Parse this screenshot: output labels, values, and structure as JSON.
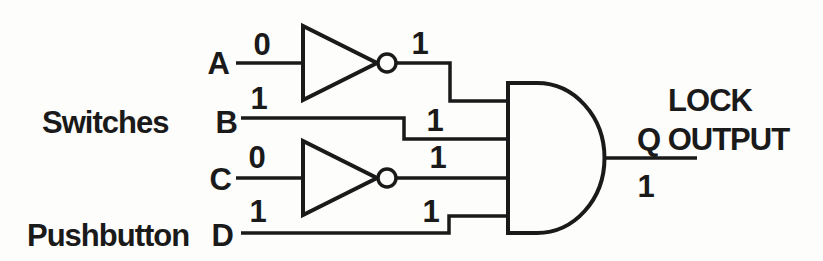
{
  "circuit": {
    "type": "logic-gate-diagram",
    "colors": {
      "ink": "#1a1a1a",
      "background": "#fdfdfc"
    },
    "group_labels": {
      "switches": "Switches",
      "pushbutton": "Pushbutton"
    },
    "inputs": [
      {
        "name": "A",
        "value": "0",
        "through": "NOT",
        "inverter_output": "1"
      },
      {
        "name": "B",
        "value": "1",
        "gate_input_value": "1"
      },
      {
        "name": "C",
        "value": "0",
        "through": "NOT",
        "inverter_output": "1"
      },
      {
        "name": "D",
        "value": "1",
        "gate_input_value": "1"
      }
    ],
    "gate": {
      "type": "AND",
      "input_count": 4
    },
    "output": {
      "label_top": "LOCK",
      "label": "Q OUTPUT",
      "value": "1"
    }
  }
}
